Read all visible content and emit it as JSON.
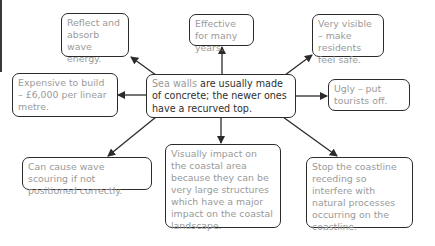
{
  "diagram": {
    "type": "spider-diagram",
    "center": {
      "highlight": "Sea walls",
      "text": " are usually made of concrete; the newer ones have a recurved top."
    },
    "nodes": [
      {
        "id": "reflect",
        "text": "Reflect and absorb wave energy."
      },
      {
        "id": "effective",
        "text": "Effective for many years."
      },
      {
        "id": "visible",
        "text": "Very visible – make residents feel safe."
      },
      {
        "id": "expensive",
        "text": "Expensive to build – £6,000 per linear metre."
      },
      {
        "id": "ugly",
        "text": "Ugly – put tourists off."
      },
      {
        "id": "scouring",
        "text": "Can cause wave scouring if not positioned correctly."
      },
      {
        "id": "visual",
        "text": "Visually impact on the coastal area because they can be very large structures which have a major impact on the coastal landscape."
      },
      {
        "id": "coastline",
        "text": "Stop the coastline receding so interfere with natural processes occurring on the coastline."
      }
    ],
    "colors": {
      "border": "#2b2b2b",
      "node_text": "#9a9a9a",
      "center_text": "#2f2f2f",
      "arrow": "#2b2b2b"
    }
  }
}
